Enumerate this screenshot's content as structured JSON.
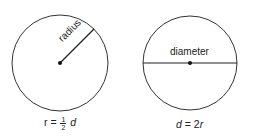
{
  "diagrams": [
    {
      "id": "radius-circle",
      "segment_label": "radius",
      "formula": {
        "lhs": "r",
        "eq": "=",
        "frac_num": "1",
        "frac_den": "2",
        "rhs_var": "d"
      }
    },
    {
      "id": "diameter-circle",
      "segment_label": "diameter",
      "formula": {
        "lhs_var": "d",
        "eq": "=",
        "rhs": "2",
        "rhs_var": "r"
      }
    }
  ],
  "colors": {
    "stroke": "#333333",
    "background": "#ffffff"
  }
}
